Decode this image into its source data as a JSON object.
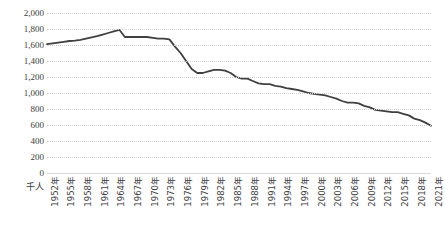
{
  "axes": {
    "y_unit_label": "千人",
    "y_ticks": [
      "2,000",
      "1,800",
      "1,600",
      "1,400",
      "1,200",
      "1,000",
      "800",
      "600",
      "400",
      "200",
      "0"
    ],
    "x_ticks": [
      "1952年",
      "1955年",
      "1958年",
      "1961年",
      "1964年",
      "1967年",
      "1970年",
      "1973年",
      "1976年",
      "1979年",
      "1982年",
      "1985年",
      "1988年",
      "1991年",
      "1994年",
      "1997年",
      "2000年",
      "2003年",
      "2006年",
      "2009年",
      "2012年",
      "2015年",
      "2018年",
      "2021年"
    ]
  },
  "caption": "",
  "style": {
    "line_color": "#404040",
    "gridline_color": "#d3d3d3",
    "axis_color": "#d9d9d9",
    "background": "#ffffff"
  },
  "chart_data": {
    "type": "line",
    "title": "",
    "subtitle": "",
    "xlabel": "",
    "ylabel": "千人",
    "unit": "千人",
    "ylim": [
      0,
      2000
    ],
    "ytick_step": 200,
    "grid": true,
    "legend": false,
    "x_tick_interval_years": 3,
    "x": [
      1952,
      1953,
      1954,
      1955,
      1956,
      1957,
      1958,
      1959,
      1960,
      1961,
      1962,
      1963,
      1964,
      1965,
      1966,
      1967,
      1968,
      1969,
      1970,
      1971,
      1972,
      1973,
      1974,
      1975,
      1976,
      1977,
      1978,
      1979,
      1980,
      1981,
      1982,
      1983,
      1984,
      1985,
      1986,
      1987,
      1988,
      1989,
      1990,
      1991,
      1992,
      1993,
      1994,
      1995,
      1996,
      1997,
      1998,
      1999,
      2000,
      2001,
      2002,
      2003,
      2004,
      2005,
      2006,
      2007,
      2008,
      2009,
      2010,
      2011,
      2012,
      2013,
      2014,
      2015,
      2016,
      2017,
      2018,
      2019,
      2020,
      2021
    ],
    "series": [
      {
        "name": "出生数",
        "color": "#404040",
        "values": [
          1610,
          1620,
          1630,
          1640,
          1650,
          1655,
          1665,
          1680,
          1695,
          1710,
          1730,
          1750,
          1770,
          1790,
          1700,
          1700,
          1700,
          1700,
          1700,
          1690,
          1680,
          1680,
          1670,
          1580,
          1500,
          1400,
          1300,
          1250,
          1250,
          1270,
          1290,
          1290,
          1280,
          1250,
          1200,
          1180,
          1180,
          1150,
          1120,
          1110,
          1110,
          1090,
          1080,
          1060,
          1050,
          1040,
          1020,
          1000,
          990,
          980,
          970,
          950,
          930,
          900,
          880,
          880,
          870,
          840,
          820,
          790,
          780,
          770,
          760,
          760,
          740,
          720,
          680,
          660,
          630,
          590
        ]
      }
    ],
    "notes": [
      "ピークは1949年前後の第1次ベビーブームに続く期間で約1,790千人",
      "1966年(丙午)に急減",
      "1973年前後に第2次ベビーブーム",
      "以降は長期的に減少し、近年は約550〜600千人で推移"
    ]
  }
}
